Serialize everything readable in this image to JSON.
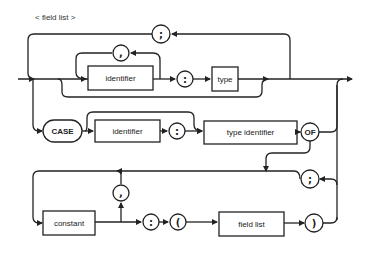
{
  "title": "< field list >",
  "nodes": {
    "semicolon_top": ";",
    "comma_top": ",",
    "identifier_1": "identifier",
    "colon_1": ":",
    "type": "type",
    "case": "CASE",
    "identifier_2": "identifier",
    "colon_2": ":",
    "type_identifier": "type identifier",
    "of": "OF",
    "semicolon_variant": ";",
    "comma_constant": ",",
    "constant": "constant",
    "colon_3": ":",
    "lparen": "(",
    "field_list": "field list",
    "rparen": ")"
  }
}
